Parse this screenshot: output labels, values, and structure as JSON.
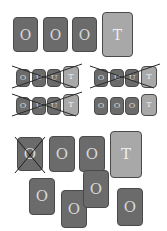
{
  "colors": {
    "background": "#ffffff",
    "dark_card": "#6b6b6b",
    "light_card": "#a8a8a8",
    "border": "#4a4a4a",
    "cross_line": "#2a2a2a"
  },
  "top_row": {
    "cards": [
      {
        "label": "O",
        "shade": "dark"
      },
      {
        "label": "O",
        "shade": "dark"
      },
      {
        "label": "O",
        "shade": "dark"
      },
      {
        "label": "T",
        "shade": "light"
      }
    ]
  },
  "middle_grid": {
    "groups": [
      {
        "crossed": true,
        "cards": [
          {
            "label": "O"
          },
          {
            "label": "U"
          },
          {
            "label": "U"
          },
          {
            "label": "T"
          }
        ]
      },
      {
        "crossed": true,
        "cards": [
          {
            "label": "O"
          },
          {
            "label": "U"
          },
          {
            "label": "U"
          },
          {
            "label": "T"
          }
        ]
      },
      {
        "crossed": true,
        "cards": [
          {
            "label": "O"
          },
          {
            "label": "U"
          },
          {
            "label": "U"
          },
          {
            "label": "T"
          }
        ]
      },
      {
        "crossed": false,
        "cards": [
          {
            "label": "O"
          },
          {
            "label": "O"
          },
          {
            "label": "O"
          },
          {
            "label": "T"
          }
        ]
      }
    ]
  },
  "bottom_cluster": {
    "row_cards": [
      {
        "label": "O",
        "shade": "dark",
        "crossed": true
      },
      {
        "label": "O",
        "shade": "dark",
        "crossed": false
      },
      {
        "label": "O",
        "shade": "dark",
        "crossed": false
      },
      {
        "label": "T",
        "shade": "light",
        "crossed": false
      }
    ],
    "scattered_cards": [
      {
        "label": "O"
      },
      {
        "label": "O"
      },
      {
        "label": "O"
      },
      {
        "label": "O"
      }
    ]
  }
}
